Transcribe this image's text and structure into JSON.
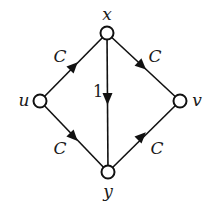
{
  "diagram": {
    "type": "flow-network",
    "nodes": [
      {
        "id": "x",
        "label": "x",
        "cx": 107,
        "cy": 33
      },
      {
        "id": "u",
        "label": "u",
        "cx": 40,
        "cy": 101
      },
      {
        "id": "v",
        "label": "v",
        "cx": 180,
        "cy": 101
      },
      {
        "id": "y",
        "label": "y",
        "cx": 108,
        "cy": 172
      }
    ],
    "edges": [
      {
        "from": "u",
        "to": "x",
        "label": "C"
      },
      {
        "from": "x",
        "to": "v",
        "label": "C"
      },
      {
        "from": "u",
        "to": "y",
        "label": "C"
      },
      {
        "from": "y",
        "to": "v",
        "label": "C"
      },
      {
        "from": "x",
        "to": "y",
        "label": "1"
      }
    ],
    "labels": {
      "x": "x",
      "u": "u",
      "v": "v",
      "y": "y",
      "edge_ux": "C",
      "edge_xv": "C",
      "edge_uy": "C",
      "edge_yv": "C",
      "edge_xy": "1"
    },
    "colors": {
      "stroke": "#111111",
      "node_fill": "#ffffff",
      "background": "#ffffff"
    }
  }
}
